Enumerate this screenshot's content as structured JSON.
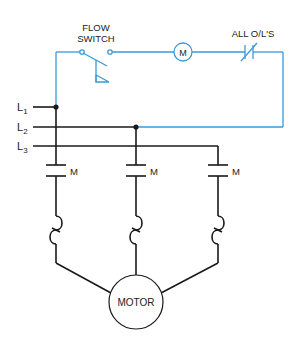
{
  "diagram": {
    "colors": {
      "control": "#3a9ad9",
      "power": "#1a1a1a",
      "text": "#222222"
    },
    "control_circuit": {
      "flow_switch_label_line1": "FLOW",
      "flow_switch_label_line2": "SWITCH",
      "coil_label": "M",
      "overload_label": "ALL O/L'S"
    },
    "lines": {
      "l1": "L",
      "l1_sub": "1",
      "l2": "L",
      "l2_sub": "2",
      "l3": "L",
      "l3_sub": "3"
    },
    "contacts": [
      {
        "label": "M"
      },
      {
        "label": "M"
      },
      {
        "label": "M"
      }
    ],
    "motor": {
      "label": "MOTOR"
    }
  }
}
